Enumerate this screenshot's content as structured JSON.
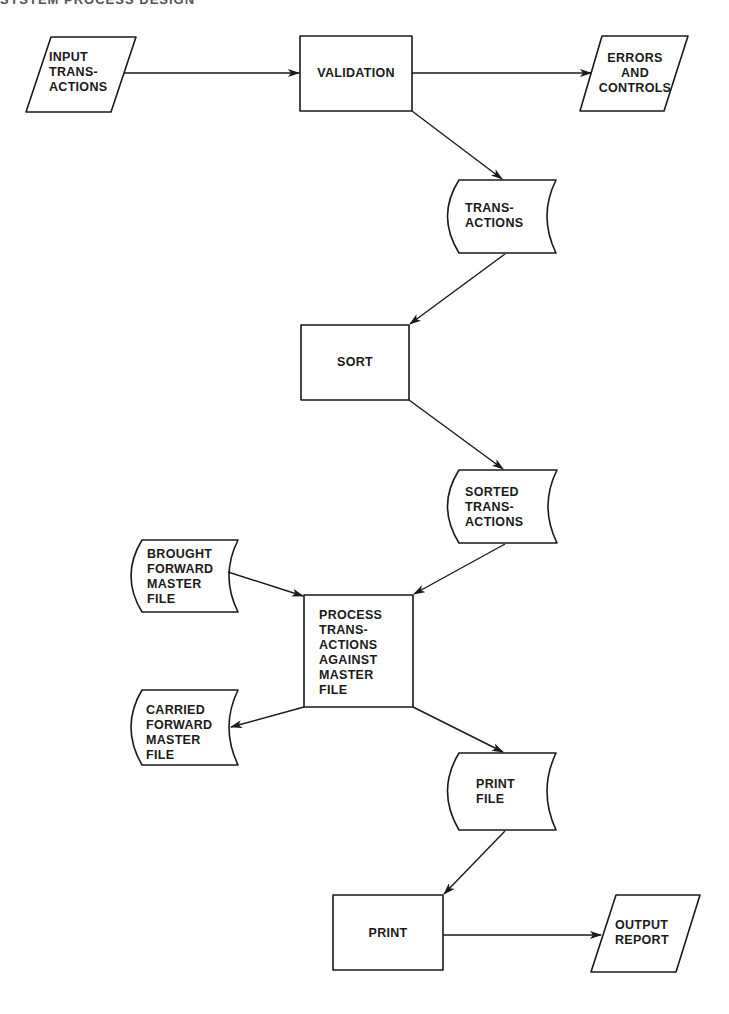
{
  "page": {
    "header_fragment": "SYSTEM PROCESS DESIGN"
  },
  "diagram": {
    "type": "flowchart",
    "stroke_color": "#1a1a1a",
    "nodes": {
      "input_transactions": {
        "shape": "parallelogram",
        "label": "INPUT\nTRANS-\nACTIONS"
      },
      "validation": {
        "shape": "process",
        "label": "VALIDATION"
      },
      "errors_and_controls": {
        "shape": "parallelogram",
        "label": "ERRORS\nAND\nCONTROLS"
      },
      "transactions": {
        "shape": "tape-file",
        "label": "TRANS-\nACTIONS"
      },
      "sort": {
        "shape": "process",
        "label": "SORT"
      },
      "sorted_transactions": {
        "shape": "tape-file",
        "label": "SORTED\nTRANS-\nACTIONS"
      },
      "brought_forward_master_file": {
        "shape": "tape-file",
        "label": "BROUGHT\nFORWARD\nMASTER\nFILE"
      },
      "process_transactions": {
        "shape": "process",
        "label": "PROCESS\nTRANS-\nACTIONS\nAGAINST\nMASTER\nFILE"
      },
      "carried_forward_master_file": {
        "shape": "tape-file",
        "label": "CARRIED\nFORWARD\nMASTER\nFILE"
      },
      "print_file": {
        "shape": "tape-file",
        "label": "PRINT\nFILE"
      },
      "print": {
        "shape": "process",
        "label": "PRINT"
      },
      "output_report": {
        "shape": "parallelogram",
        "label": "OUTPUT\nREPORT"
      }
    },
    "edges": [
      {
        "from": "INPUT TRANSACTIONS",
        "to": "VALIDATION"
      },
      {
        "from": "VALIDATION",
        "to": "ERRORS AND CONTROLS"
      },
      {
        "from": "VALIDATION",
        "to": "TRANSACTIONS"
      },
      {
        "from": "TRANSACTIONS",
        "to": "SORT"
      },
      {
        "from": "SORT",
        "to": "SORTED TRANSACTIONS"
      },
      {
        "from": "SORTED TRANSACTIONS",
        "to": "PROCESS TRANSACTIONS AGAINST MASTER FILE"
      },
      {
        "from": "BROUGHT FORWARD MASTER FILE",
        "to": "PROCESS TRANSACTIONS AGAINST MASTER FILE"
      },
      {
        "from": "PROCESS TRANSACTIONS AGAINST MASTER FILE",
        "to": "CARRIED FORWARD MASTER FILE"
      },
      {
        "from": "PROCESS TRANSACTIONS AGAINST MASTER FILE",
        "to": "PRINT FILE"
      },
      {
        "from": "PRINT FILE",
        "to": "PRINT"
      },
      {
        "from": "PRINT",
        "to": "OUTPUT REPORT"
      }
    ]
  }
}
